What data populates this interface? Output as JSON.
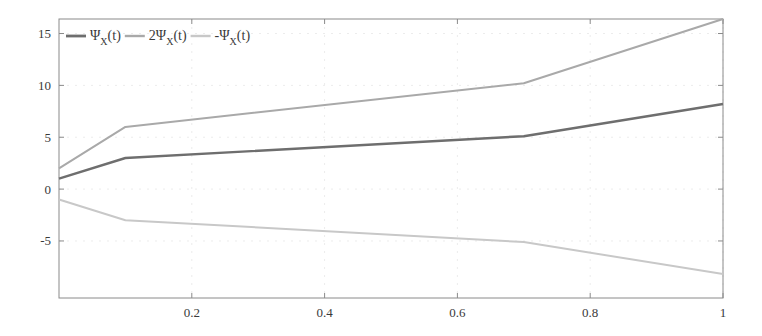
{
  "chart_data": {
    "type": "line",
    "title": "",
    "xlabel": "",
    "ylabel": "",
    "xlim": [
      0,
      1
    ],
    "ylim": [
      -10.5,
      16.4
    ],
    "x_ticks": [
      0.2,
      0.4,
      0.6,
      0.8,
      1
    ],
    "x_tick_labels": [
      "0.2",
      "0.4",
      "0.6",
      "0.8",
      "1"
    ],
    "y_ticks": [
      15,
      10,
      5,
      0,
      -5
    ],
    "y_tick_labels": [
      "15",
      "10",
      "5",
      "0",
      "-5"
    ],
    "grid": true,
    "legend_position": "top-left",
    "x": [
      0,
      0.1,
      0.7,
      1
    ],
    "series": [
      {
        "name": "Ψ_X(t)",
        "label_main": "Ψ",
        "label_sub": "X",
        "label_tail": "(t)",
        "values": [
          1,
          3,
          5.1,
          8.2
        ],
        "color": "#6e6e6e",
        "width": 2.4
      },
      {
        "name": "2Ψ_X(t)",
        "label_main": "2Ψ",
        "label_sub": "X",
        "label_tail": "(t)",
        "values": [
          2,
          6,
          10.2,
          16.4
        ],
        "color": "#a9a9a9",
        "width": 2.0
      },
      {
        "name": "-Ψ_X(t)",
        "label_main": "-Ψ",
        "label_sub": "X",
        "label_tail": "(t)",
        "values": [
          -1,
          -3,
          -5.1,
          -8.2
        ],
        "color": "#c8c8c8",
        "width": 2.0
      }
    ]
  },
  "layout": {
    "plot_left": 59,
    "plot_right": 723,
    "plot_top": 19,
    "plot_bottom": 298,
    "axis_color": "#8a8a8a",
    "grid_color": "#ececec"
  }
}
